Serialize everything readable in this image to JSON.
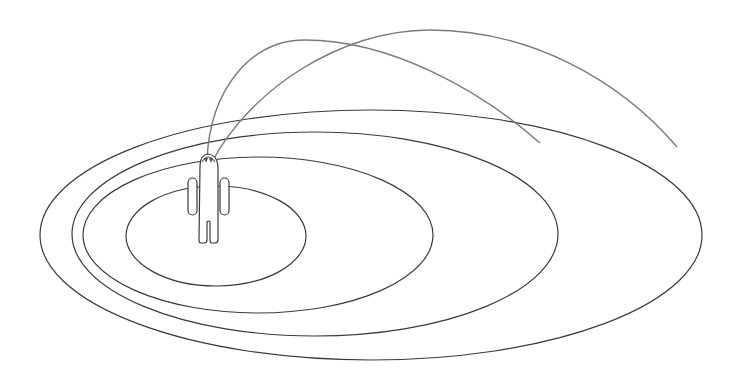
{
  "diagram": {
    "type": "concentric-zones-with-person",
    "colors": {
      "background": "#ffffff",
      "ring_stroke": "#3a3a3a",
      "arc_stroke": "#7a7a7a",
      "figure_stroke": "#3a3a3a"
    },
    "rings": [
      {
        "name": "outer-ring",
        "cx": 371,
        "cy": 235,
        "rx": 331,
        "ry": 125
      },
      {
        "name": "second-ring",
        "cx": 315,
        "cy": 234,
        "rx": 243,
        "ry": 102
      },
      {
        "name": "third-ring",
        "cx": 258,
        "cy": 235,
        "rx": 175,
        "ry": 78
      },
      {
        "name": "inner-ring",
        "cx": 216,
        "cy": 236,
        "rx": 90,
        "ry": 50
      }
    ],
    "arcs": [
      {
        "name": "short-arc",
        "d": "M 207 160 C 210 90, 250 40, 305 40 C 390 40, 480 90, 540 143"
      },
      {
        "name": "long-arc",
        "d": "M 212 162 C 250 90, 340 30, 430 30 C 530 30, 620 80, 677 147"
      }
    ]
  }
}
